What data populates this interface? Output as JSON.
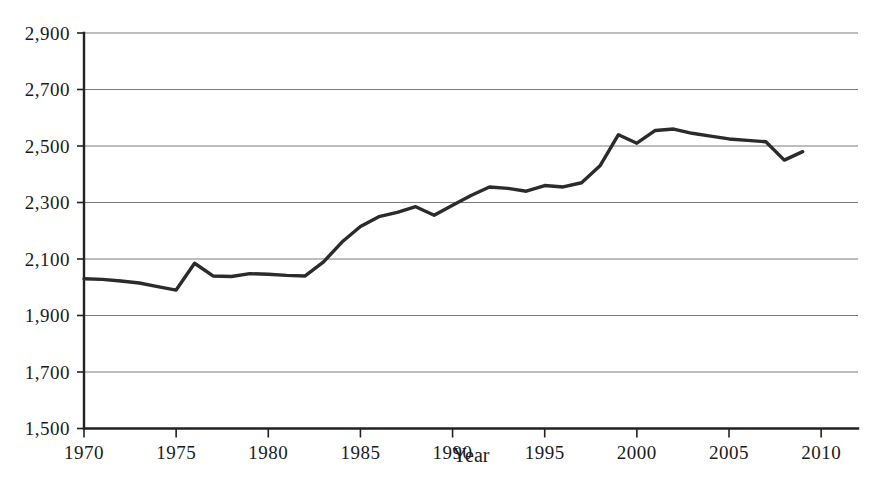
{
  "chart_data": {
    "type": "line",
    "title": "",
    "subtitle": "",
    "xlabel": "Year",
    "ylabel": "",
    "xlim": [
      1970,
      2012
    ],
    "ylim": [
      1500,
      2900
    ],
    "grid": "horizontal",
    "legend": "none",
    "x_tick_labels": [
      "1970",
      "1975",
      "1980",
      "1985",
      "1990",
      "1995",
      "2000",
      "2005",
      "2010"
    ],
    "x_ticks": [
      1970,
      1975,
      1980,
      1985,
      1990,
      1995,
      2000,
      2005,
      2010
    ],
    "y_tick_labels": [
      "1,500",
      "1,700",
      "1,900",
      "2,100",
      "2,300",
      "2,500",
      "2,700",
      "2,900"
    ],
    "y_ticks": [
      1500,
      1700,
      1900,
      2100,
      2300,
      2500,
      2700,
      2900
    ],
    "series": [
      {
        "name": "value",
        "color": "#2b2b2b",
        "x": [
          1970,
          1971,
          1972,
          1973,
          1974,
          1975,
          1976,
          1977,
          1978,
          1979,
          1980,
          1981,
          1982,
          1983,
          1984,
          1985,
          1986,
          1987,
          1988,
          1989,
          1990,
          1991,
          1992,
          1993,
          1994,
          1995,
          1996,
          1997,
          1998,
          1999,
          2000,
          2001,
          2002,
          2003,
          2004,
          2005,
          2006,
          2007,
          2008,
          2009
        ],
        "values": [
          2030,
          2028,
          2022,
          2015,
          2002,
          1990,
          2085,
          2040,
          2038,
          2048,
          2046,
          2042,
          2040,
          2090,
          2160,
          2215,
          2250,
          2265,
          2285,
          2255,
          2290,
          2325,
          2355,
          2350,
          2340,
          2360,
          2355,
          2370,
          2430,
          2540,
          2510,
          2555,
          2560,
          2545,
          2535,
          2525,
          2520,
          2515,
          2450,
          2480
        ]
      }
    ]
  },
  "axis": {
    "x_title": "Year"
  }
}
